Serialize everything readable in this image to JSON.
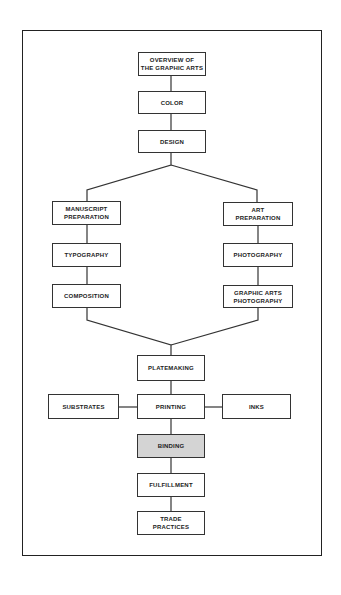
{
  "diagram": {
    "type": "flowchart",
    "highlight_color": "#d4d4d4",
    "nodes": {
      "overview": {
        "label": "OVERVIEW OF\nTHE GRAPHIC ARTS"
      },
      "color": {
        "label": "COLOR"
      },
      "design": {
        "label": "DESIGN"
      },
      "manuscript": {
        "label": "MANUSCRIPT\nPREPARATION"
      },
      "typography": {
        "label": "TYPOGRAPHY"
      },
      "composition": {
        "label": "COMPOSITION"
      },
      "art": {
        "label": "ART\nPREPARATION"
      },
      "photography": {
        "label": "PHOTOGRAPHY"
      },
      "ga_photography": {
        "label": "GRAPHIC ARTS\nPHOTOGRAPHY"
      },
      "platemaking": {
        "label": "PLATEMAKING"
      },
      "substrates": {
        "label": "SUBSTRATES"
      },
      "printing": {
        "label": "PRINTING"
      },
      "inks": {
        "label": "INKS"
      },
      "binding": {
        "label": "BINDING",
        "highlighted": true
      },
      "fulfillment": {
        "label": "FULFILLMENT"
      },
      "trade": {
        "label": "TRADE\nPRACTICES"
      }
    },
    "edges": [
      [
        "overview",
        "color"
      ],
      [
        "color",
        "design"
      ],
      [
        "design",
        "manuscript"
      ],
      [
        "design",
        "art"
      ],
      [
        "manuscript",
        "typography"
      ],
      [
        "typography",
        "composition"
      ],
      [
        "art",
        "photography"
      ],
      [
        "photography",
        "ga_photography"
      ],
      [
        "composition",
        "platemaking"
      ],
      [
        "ga_photography",
        "platemaking"
      ],
      [
        "platemaking",
        "printing"
      ],
      [
        "substrates",
        "printing"
      ],
      [
        "inks",
        "printing"
      ],
      [
        "printing",
        "binding"
      ],
      [
        "binding",
        "fulfillment"
      ],
      [
        "fulfillment",
        "trade"
      ]
    ]
  }
}
